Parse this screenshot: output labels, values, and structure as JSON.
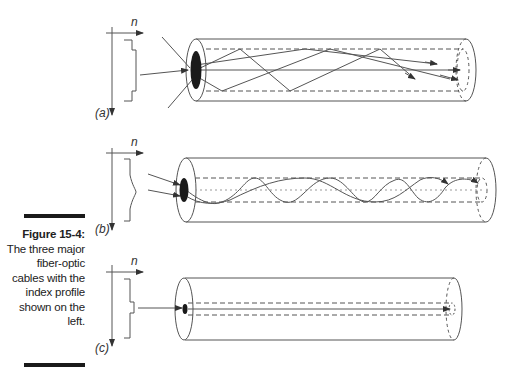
{
  "figure": {
    "label": "Figure 15-4:",
    "caption": "The three major fiber-optic cables with the index profile shown on the left."
  },
  "axis_label": "n",
  "panels": [
    {
      "id": "a",
      "label": "(a)",
      "profile": "step-index",
      "description": "multimode step-index fiber, rays zig-zag reflecting off core boundary"
    },
    {
      "id": "b",
      "label": "(b)",
      "profile": "graded-index",
      "description": "multimode graded-index fiber, rays follow sinusoidal paths"
    },
    {
      "id": "c",
      "label": "(c)",
      "profile": "single-mode step-index",
      "description": "single-mode fiber, single straight ray along axis"
    }
  ],
  "colors": {
    "line": "#444444",
    "core_fill": "#1a1a1a",
    "caption_bar": "#1a1a1a"
  }
}
